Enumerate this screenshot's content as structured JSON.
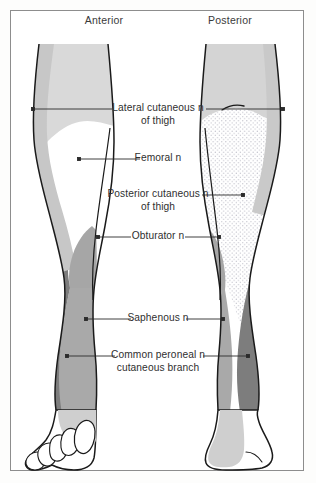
{
  "figure": {
    "type": "anatomical-diagram",
    "views": {
      "left": "Anterior",
      "right": "Posterior"
    }
  },
  "labels": [
    {
      "id": "lateral-cutaneous-thigh",
      "line1": "Lateral cutaneous n",
      "line2": "of thigh"
    },
    {
      "id": "femoral",
      "line1": "Femoral n",
      "line2": ""
    },
    {
      "id": "posterior-cutaneous-thigh",
      "line1": "Posterior cutaneous n",
      "line2": "of thigh"
    },
    {
      "id": "obturator",
      "line1": "Obturator n",
      "line2": ""
    },
    {
      "id": "saphenous",
      "line1": "Saphenous n",
      "line2": ""
    },
    {
      "id": "common-peroneal",
      "line1": "Common peroneal n",
      "line2": "cutaneous branch"
    }
  ],
  "colors": {
    "outline": "#1a1a1a",
    "border": "#8d8d8d",
    "leader": "#2a2a2a",
    "text": "#2f2f2f",
    "skin": "#ffffff",
    "pale_gray": "#d6d6d6",
    "light_gray": "#c9c9c9",
    "mid_gray": "#a9a9a9",
    "dark_gray": "#7d7d7d",
    "stipple_dot": "#b9b9c4",
    "foot_gray": "#cfcfcf"
  }
}
